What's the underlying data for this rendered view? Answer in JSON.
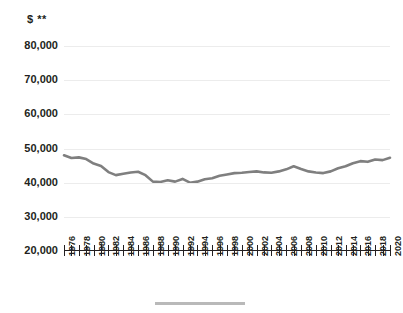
{
  "chart_data": {
    "type": "line",
    "title": "",
    "subtitle": "",
    "xlabel": "",
    "ylabel": "$ **",
    "ylim": [
      20000,
      80000
    ],
    "xlim": [
      1976,
      2020
    ],
    "ytick_labels": [
      "80,000",
      "70,000",
      "60,000",
      "50,000",
      "40,000",
      "30,000",
      "20,000"
    ],
    "ytick_values": [
      80000,
      70000,
      60000,
      50000,
      40000,
      30000,
      20000
    ],
    "xtick_labels": [
      "1976",
      "1978",
      "1980",
      "1982",
      "1984",
      "1986",
      "1988",
      "1990",
      "1992",
      "1994",
      "1996",
      "1998",
      "2000",
      "2002",
      "2004",
      "2006",
      "2008",
      "2010",
      "2012",
      "2014",
      "2016",
      "2018",
      "2020"
    ],
    "grid": true,
    "legend_position": "bottom",
    "legend_entries": [],
    "line_color": "#7f7f7f",
    "x": [
      1976,
      1977,
      1978,
      1979,
      1980,
      1981,
      1982,
      1983,
      1984,
      1985,
      1986,
      1987,
      1988,
      1989,
      1990,
      1991,
      1992,
      1993,
      1994,
      1995,
      1996,
      1997,
      1998,
      1999,
      2000,
      2001,
      2002,
      2003,
      2004,
      2005,
      2006,
      2007,
      2008,
      2009,
      2010,
      2011,
      2012,
      2013,
      2014,
      2015,
      2016,
      2017,
      2018,
      2019,
      2020
    ],
    "series": [
      {
        "name": "Median household income",
        "values": [
          48000,
          47200,
          47400,
          46900,
          45600,
          44900,
          43100,
          42200,
          42600,
          43000,
          43200,
          42200,
          40300,
          40200,
          40700,
          40300,
          41100,
          40000,
          40300,
          41000,
          41300,
          42000,
          42400,
          42800,
          42900,
          43100,
          43300,
          43000,
          42900,
          43300,
          43900,
          44800,
          44000,
          43300,
          43000,
          42800,
          43300,
          44200,
          44800,
          45700,
          46300,
          46100,
          46800,
          46600,
          47300
        ]
      }
    ]
  },
  "axis": {
    "y_title": "$ **"
  }
}
